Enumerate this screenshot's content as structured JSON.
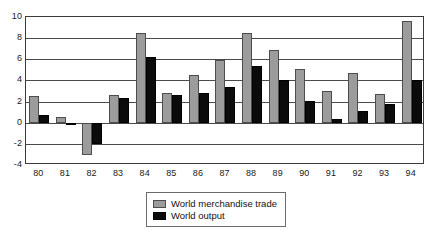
{
  "chart_data": {
    "type": "bar",
    "title": "",
    "xlabel": "",
    "ylabel": "",
    "ylim": [
      -4,
      10
    ],
    "yticks": [
      10,
      8,
      6,
      4,
      2,
      0,
      -2,
      -4
    ],
    "grid": true,
    "legend_position": "bottom-center",
    "categories": [
      "80",
      "81",
      "82",
      "83",
      "84",
      "85",
      "86",
      "87",
      "88",
      "89",
      "90",
      "91",
      "92",
      "93",
      "94"
    ],
    "series": [
      {
        "name": "World merchandise trade",
        "color": "#9c9c9c",
        "values": [
          2.5,
          0.5,
          -3.1,
          2.6,
          8.5,
          2.85,
          4.5,
          5.9,
          8.5,
          6.9,
          5.1,
          3.0,
          4.7,
          2.7,
          9.65
        ]
      },
      {
        "name": "World output",
        "color": "#0b0b0b",
        "values": [
          0.7,
          -0.2,
          -2.0,
          2.3,
          6.25,
          2.65,
          2.85,
          3.4,
          5.4,
          4.0,
          2.1,
          0.35,
          1.1,
          1.75,
          4.0
        ]
      }
    ]
  },
  "legend": {
    "items": [
      {
        "label": "World merchandise trade",
        "swatch": "trade"
      },
      {
        "label": "World output",
        "swatch": "output"
      }
    ]
  }
}
